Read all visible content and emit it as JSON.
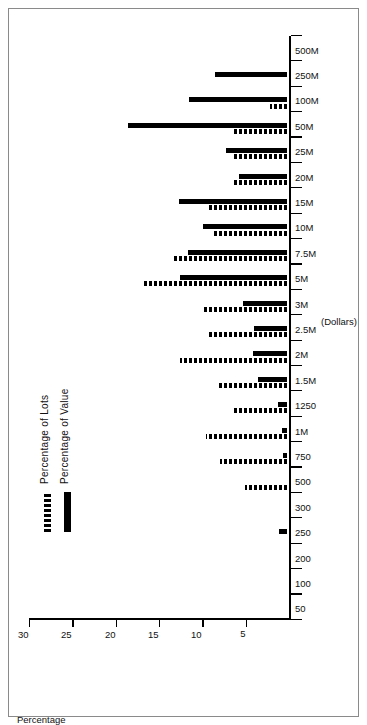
{
  "chart_data": {
    "type": "bar",
    "title": "",
    "xlabel": "(Dollars)",
    "ylabel": "Percentage",
    "ylim": [
      0,
      30
    ],
    "yticks": [
      5,
      10,
      15,
      20,
      25,
      30
    ],
    "grid": false,
    "legend_position": "upper-left",
    "categories": [
      "50",
      "100",
      "200",
      "250",
      "300",
      "500",
      "750",
      "1M",
      "1250",
      "1.5M",
      "2M",
      "2.5M",
      "3M",
      "5M",
      "7.5M",
      "10M",
      "15M",
      "20M",
      "25M",
      "50M",
      "100M",
      "250M",
      "500M"
    ],
    "series": [
      {
        "name": "Percentage of Lots",
        "style": "dashed",
        "color": "#000000",
        "values": [
          0,
          0,
          0,
          0,
          0,
          4.9,
          7.7,
          9.3,
          6.3,
          8.0,
          12.4,
          9.0,
          9.6,
          16.5,
          13.0,
          8.6,
          9.1,
          6.3,
          6.4,
          6.2,
          2.0,
          0,
          0
        ]
      },
      {
        "name": "Percentage of Value",
        "style": "solid",
        "color": "#000000",
        "values": [
          0,
          0,
          0,
          0.9,
          0,
          0,
          0.5,
          0.6,
          1.0,
          3.3,
          3.9,
          3.8,
          5.1,
          12.4,
          11.4,
          9.7,
          12.5,
          5.5,
          7.0,
          18.4,
          11.3,
          8.3,
          0
        ]
      }
    ]
  },
  "axes": {
    "value_axis_title": "Percentage",
    "category_axis_title": "(Dollars)",
    "value_ticks": [
      "5",
      "10",
      "15",
      "20",
      "25",
      "30"
    ],
    "category_ticks": [
      "50",
      "100",
      "200",
      "250",
      "300",
      "500",
      "750",
      "1M",
      "1250",
      "1.5M",
      "2M",
      "2.5M",
      "3M",
      "5M",
      "7.5M",
      "10M",
      "15M",
      "20M",
      "25M",
      "50M",
      "100M",
      "250M",
      "500M"
    ]
  },
  "legend": {
    "items": [
      {
        "label": "Percentage of Lots",
        "style": "lots"
      },
      {
        "label": "Percentage of Value",
        "style": "value"
      }
    ]
  }
}
